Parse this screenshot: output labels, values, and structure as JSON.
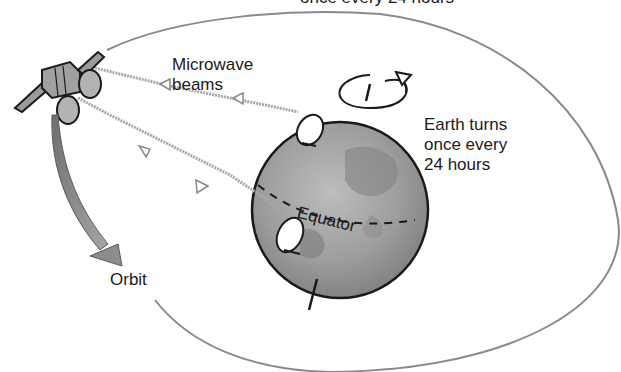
{
  "diagram": {
    "title_partial": "once every 24 hours",
    "labels": {
      "microwave_beams": [
        "Microwave",
        "beams"
      ],
      "earth_turns": [
        "Earth turns",
        "once every",
        "24 hours"
      ],
      "equator": "Equator",
      "orbit": "Orbit"
    },
    "elements": {
      "satellite": "satellite with two dish antennas and solar panels",
      "earth": "Earth globe with rotation axis",
      "ground_stations": 2,
      "microwave_beam_count": 2,
      "orbit_path": "elliptical orbit around Earth"
    },
    "colors": {
      "outline": "#1a1a1a",
      "earth_fill": "#9a9a9a",
      "beam": "#a8a8a8",
      "orbit_line": "#8a8a8a",
      "orbit_arrow": "#8c8c8c"
    }
  }
}
